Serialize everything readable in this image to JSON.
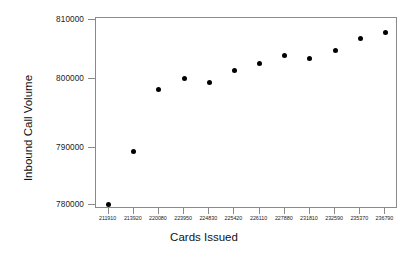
{
  "chart_data": {
    "type": "scatter",
    "title": "",
    "xlabel": "Cards Issued",
    "ylabel": "Inbound Call Volume",
    "grid": false,
    "legend": null,
    "xticklabels": [
      "211910",
      "213920",
      "220080",
      "223950",
      "224830",
      "225420",
      "226110",
      "227880",
      "231810",
      "232590",
      "235370",
      "236790"
    ],
    "yticklabels": [
      "780000",
      "790000",
      "800000",
      "810000"
    ],
    "ylim": [
      777000,
      811000
    ],
    "ytick_values": [
      780000,
      790000,
      800000,
      810000
    ],
    "x": [
      211910,
      213920,
      220080,
      223950,
      224830,
      225420,
      226110,
      227880,
      231810,
      232590,
      235370,
      236790
    ],
    "values": [
      780100,
      788700,
      798700,
      800500,
      799800,
      801800,
      802900,
      804300,
      803700,
      805100,
      807000,
      808000
    ],
    "marker": "filled-circle",
    "marker_color": "#000000",
    "axis_color": "#8a8a8a"
  }
}
